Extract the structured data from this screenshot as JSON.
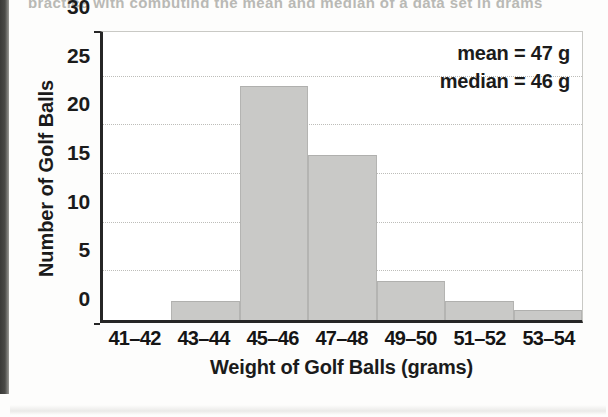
{
  "page": {
    "top_partial_text": "practice with computing the mean and median of a data set in grams",
    "binding_shadow": "#3f3f3c"
  },
  "chart_data": {
    "type": "bar",
    "title": "",
    "subtitle": "",
    "categories": [
      "41–42",
      "43–44",
      "45–46",
      "47–48",
      "49–50",
      "51–52",
      "53–54"
    ],
    "values": [
      0,
      2,
      24,
      17,
      4,
      2,
      1
    ],
    "xlabel": "Weight of Golf Balls (grams)",
    "ylabel": "Number of Golf Balls",
    "ylim": [
      0,
      30
    ],
    "yticks": [
      0,
      5,
      10,
      15,
      20,
      25,
      30
    ],
    "ytick_labels": [
      "0",
      "5",
      "10",
      "15",
      "20",
      "25",
      "30"
    ],
    "grid": "horizontal-dotted",
    "legend": "none",
    "bar_color": "#c9c9c7",
    "axis_color": "#262626",
    "gridline_color": "#bdbdb9",
    "annotations": [
      {
        "label": "mean = 47 g"
      },
      {
        "label": "median = 46 g"
      }
    ]
  }
}
